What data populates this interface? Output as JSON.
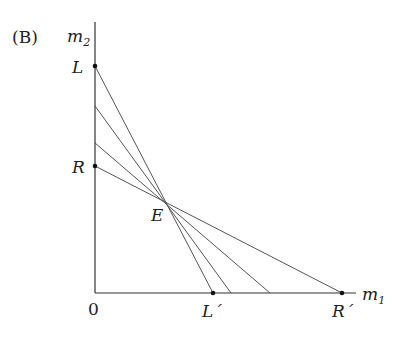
{
  "figure": {
    "panel_label": "(B)",
    "y_axis_label": "m",
    "y_axis_sub": "2",
    "x_axis_label": "m",
    "x_axis_sub": "1",
    "origin_label": "0",
    "points": {
      "L": "L",
      "R": "R",
      "E": "E",
      "L_prime": "L´",
      "R_prime": "R´"
    },
    "line_color": "#555555",
    "axis_color": "#333333"
  },
  "geometry": {
    "origin": [
      95,
      293
    ],
    "y_axis_top": 22,
    "x_axis_right": 356,
    "E": [
      168,
      205
    ],
    "lines": [
      {
        "name": "L-L'",
        "from": [
          95,
          66
        ],
        "to": [
          213,
          293
        ]
      },
      {
        "name": "mid-1",
        "from": [
          95,
          106
        ],
        "to": [
          231,
          293
        ]
      },
      {
        "name": "mid-2",
        "from": [
          95,
          143
        ],
        "to": [
          270,
          293
        ]
      },
      {
        "name": "R-R'",
        "from": [
          95,
          166
        ],
        "to": [
          342,
          293
        ]
      }
    ]
  }
}
